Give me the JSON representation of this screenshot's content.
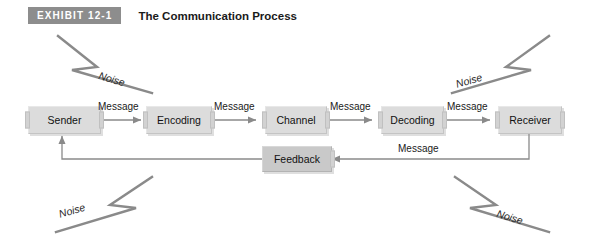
{
  "header": {
    "badge": "EXHIBIT 12-1",
    "title": "The Communication Process"
  },
  "colors": {
    "badge_bg": "#8d8d8d",
    "badge_text": "#ffffff",
    "node_fill": "#dcdcdc",
    "node_border": "#c4c4c4",
    "feedback_fill": "#c9c9c9",
    "line": "#7d7d7d",
    "text": "#111111"
  },
  "diagram": {
    "type": "flow",
    "nodes": [
      {
        "id": "sender",
        "label": "Sender"
      },
      {
        "id": "encoding",
        "label": "Encoding"
      },
      {
        "id": "channel",
        "label": "Channel"
      },
      {
        "id": "decoding",
        "label": "Decoding"
      },
      {
        "id": "receiver",
        "label": "Receiver"
      },
      {
        "id": "feedback",
        "label": "Feedback"
      }
    ],
    "edge_labels": {
      "sender_encoding": "Message",
      "encoding_channel": "Message",
      "channel_decoding": "Message",
      "decoding_receiver": "Message",
      "receiver_feedback": "Message"
    },
    "noise": [
      {
        "id": "noise-top-left",
        "label": "Noise"
      },
      {
        "id": "noise-top-right",
        "label": "Noise"
      },
      {
        "id": "noise-bottom-left",
        "label": "Noise"
      },
      {
        "id": "noise-bottom-right",
        "label": "Noise"
      }
    ]
  }
}
